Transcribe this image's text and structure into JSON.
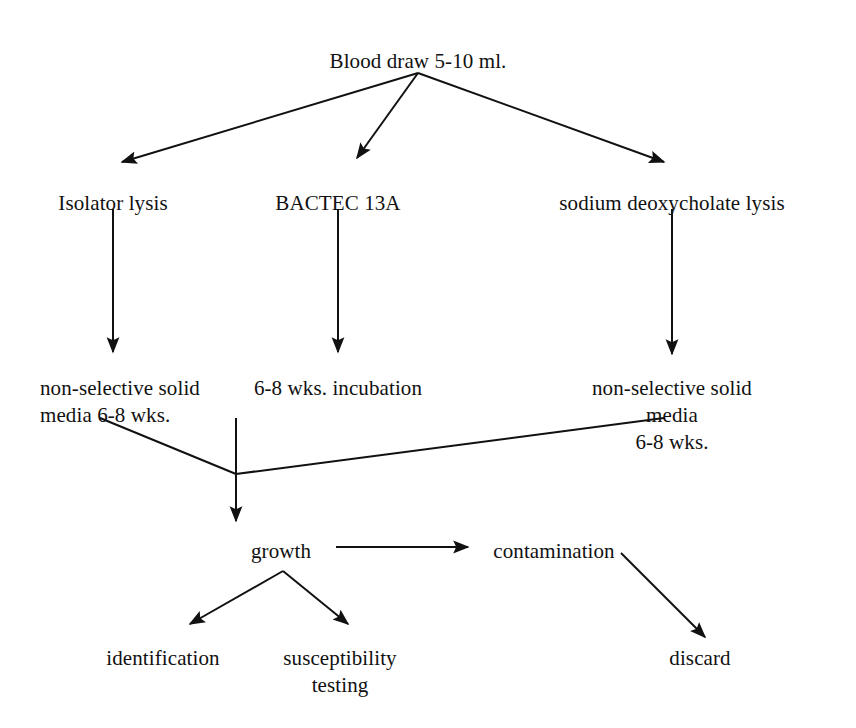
{
  "diagram": {
    "type": "flowchart",
    "title_text": "Blood culture processing methods flowchart",
    "background_color": "#ffffff",
    "stroke_color": "#111111",
    "text_color": "#111111",
    "nodes": [
      {
        "id": "blood_draw",
        "label": "Blood draw 5-10 ml.",
        "x": 418,
        "y": 48,
        "align": "center"
      },
      {
        "id": "isolator",
        "label": "Isolator lysis",
        "x": 113,
        "y": 190,
        "align": "center"
      },
      {
        "id": "bactec",
        "label": "BACTEC 13A",
        "x": 338,
        "y": 190,
        "align": "center"
      },
      {
        "id": "sodium_deoxy",
        "label": "sodium deoxycholate lysis",
        "x": 672,
        "y": 190,
        "align": "center"
      },
      {
        "id": "media_left",
        "label": "non-selective solid\nmedia 6-8 wks.",
        "x": 40,
        "y": 375,
        "align": "left"
      },
      {
        "id": "incubation",
        "label": "6-8 wks. incubation",
        "x": 338,
        "y": 375,
        "align": "center"
      },
      {
        "id": "media_right",
        "label": "non-selective solid media\n6-8 wks.",
        "x": 672,
        "y": 375,
        "align": "center"
      },
      {
        "id": "growth",
        "label": "growth",
        "x": 281,
        "y": 538,
        "align": "center"
      },
      {
        "id": "contamination",
        "label": "contamination",
        "x": 554,
        "y": 538,
        "align": "center"
      },
      {
        "id": "identification",
        "label": "identification",
        "x": 163,
        "y": 645,
        "align": "center"
      },
      {
        "id": "susceptibility",
        "label": "susceptibility\ntesting",
        "x": 340,
        "y": 645,
        "align": "center"
      },
      {
        "id": "discard",
        "label": "discard",
        "x": 700,
        "y": 645,
        "align": "center"
      }
    ],
    "edges": [
      {
        "id": "blood-to-isolator",
        "from": "blood_draw",
        "to": "isolator",
        "points": "418,73 122,162",
        "arrowhead": true
      },
      {
        "id": "blood-to-bactec",
        "from": "blood_draw",
        "to": "bactec",
        "points": "418,73 357,158",
        "arrowhead": true
      },
      {
        "id": "blood-to-sodium",
        "from": "blood_draw",
        "to": "sodium_deoxy",
        "points": "418,73 664,162",
        "arrowhead": true
      },
      {
        "id": "isolator-to-media-left",
        "from": "isolator",
        "to": "media_left",
        "points": "113,209 113,352",
        "arrowhead": true
      },
      {
        "id": "bactec-to-incubation",
        "from": "bactec",
        "to": "incubation",
        "points": "338,209 338,352",
        "arrowhead": true
      },
      {
        "id": "sodium-to-media-right",
        "from": "sodium_deoxy",
        "to": "media_right",
        "points": "672,209 672,354",
        "arrowhead": true
      },
      {
        "id": "media-left-to-growth",
        "from": "media_left",
        "to": "growth",
        "points": "100,418 236,474",
        "arrowhead": false
      },
      {
        "id": "media-right-to-growth",
        "from": "media_right",
        "to": "growth",
        "points": "664,418 236,474",
        "arrowhead": false
      },
      {
        "id": "incubation-to-growth",
        "from": "incubation",
        "to": "growth",
        "points": "236,418 236,521",
        "arrowhead": true
      },
      {
        "id": "growth-to-contamination",
        "from": "growth",
        "to": "contamination",
        "points": "336,547 468,547",
        "arrowhead": true
      },
      {
        "id": "growth-to-identification",
        "from": "growth",
        "to": "identification",
        "points": "283,571 190,624",
        "arrowhead": true
      },
      {
        "id": "growth-to-susceptibility",
        "from": "growth",
        "to": "susceptibility",
        "points": "283,571 348,624",
        "arrowhead": true
      },
      {
        "id": "contamination-to-discard",
        "from": "contamination",
        "to": "discard",
        "points": "621,553 705,637",
        "arrowhead": true
      }
    ]
  }
}
